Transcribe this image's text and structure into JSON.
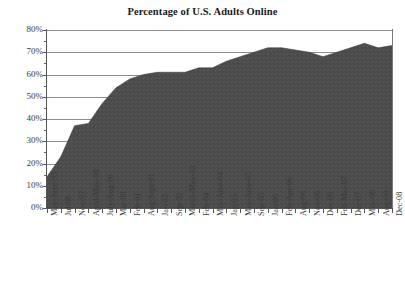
{
  "chart_data": {
    "type": "area",
    "title": "Percentage of U.S. Adults Online",
    "xlabel": "",
    "ylabel": "",
    "ylim": [
      0,
      80
    ],
    "ytick_labels": [
      "0%",
      "10%",
      "20%",
      "30%",
      "40%",
      "50%",
      "60%",
      "70%",
      "80%"
    ],
    "ytick_values": [
      0,
      10,
      20,
      30,
      40,
      50,
      60,
      70,
      80
    ],
    "grid": true,
    "grid_axis": "y",
    "legend": "none",
    "fill_color": "#4d4d4d",
    "categories": [
      "May-June-95",
      "Jul-96",
      "Nov-97",
      "April-May-98",
      "July-Aug-00",
      "Mar-00",
      "Feb-01",
      "Aug-Sept-01",
      "Jan-02",
      "Sep-02",
      "March-May-03",
      "Feb-04",
      "May-June-04",
      "Jan-05",
      "May-June-05",
      "Sep-05",
      "Jan-06",
      "Feb-Apr-06",
      "Aug-06",
      "Nov-06",
      "Dec-06",
      "Feb-Mar-07",
      "Dec-07",
      "May-08",
      "Aug-08",
      "Dec-08"
    ],
    "values": [
      14,
      23,
      37,
      38,
      47,
      54,
      58,
      60,
      61,
      61,
      61,
      63,
      63,
      66,
      68,
      70,
      72,
      72,
      71,
      70,
      68,
      70,
      72,
      74,
      72,
      73
    ],
    "series": [
      {
        "name": "Percentage of U.S. Adults Online",
        "values": [
          14,
          23,
          37,
          38,
          47,
          54,
          58,
          60,
          61,
          61,
          61,
          63,
          63,
          66,
          68,
          70,
          72,
          72,
          71,
          70,
          68,
          70,
          72,
          74,
          72,
          73
        ]
      }
    ]
  }
}
